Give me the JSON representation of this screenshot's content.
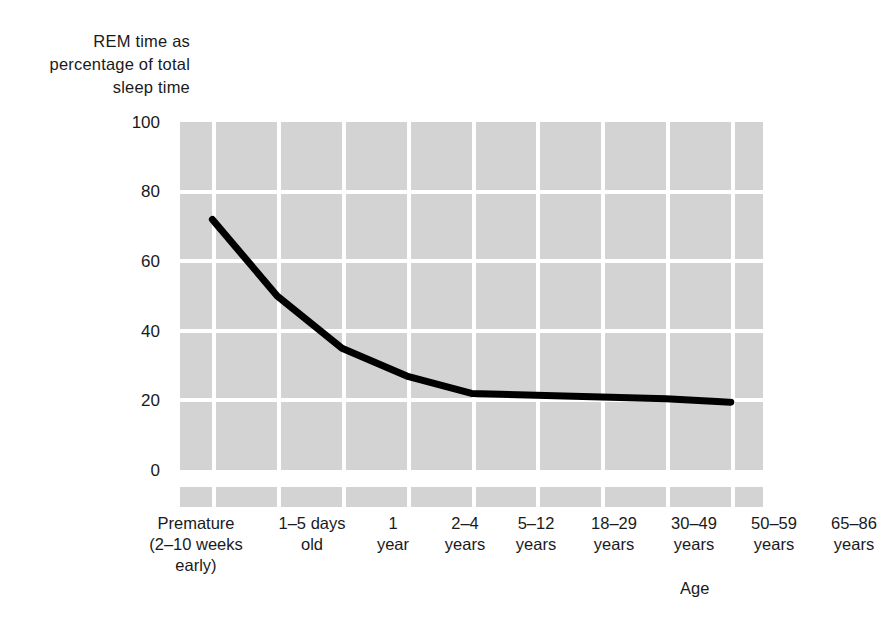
{
  "figure": {
    "y_axis_title": "REM time as\npercentage of total\nsleep time",
    "x_axis_title": "Age",
    "y_ticks": [
      "100",
      "80",
      "60",
      "40",
      "20",
      "0"
    ],
    "colors": {
      "band_fill": "#d3d3d3",
      "gridline": "#ffffff",
      "line": "#000000",
      "text": "#1a1a1a",
      "background": "#ffffff"
    }
  },
  "chart_data": {
    "type": "line",
    "title": "",
    "xlabel": "Age",
    "ylabel": "REM time as percentage of total sleep time",
    "ylim": [
      0,
      100
    ],
    "yticks": [
      0,
      20,
      40,
      60,
      80,
      100
    ],
    "grid": true,
    "legend": "none",
    "categories": [
      "Premature (2-10 weeks early)",
      "1-5 days old",
      "1 year",
      "2-4 years",
      "5-12 years",
      "18-29 years",
      "30-49 years",
      "50-59 years",
      "65-86 years"
    ],
    "category_labels": [
      "Premature\n(2–10 weeks\nearly)",
      "1–5 days\nold",
      "1\nyear",
      "2–4\nyears",
      "5–12\nyears",
      "18–29\nyears",
      "30–49\nyears",
      "50–59\nyears",
      "65–86\nyears"
    ],
    "series": [
      {
        "name": "REM time as percentage of total sleep time",
        "values": [
          72,
          50,
          35,
          27,
          22,
          21.5,
          21,
          20.5,
          19.5
        ]
      }
    ]
  }
}
